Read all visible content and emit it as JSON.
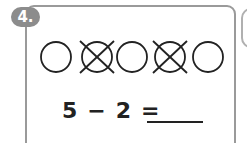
{
  "exercise": {
    "number": "4.",
    "circles": [
      {
        "cx": 56,
        "crossed": false
      },
      {
        "cx": 97,
        "crossed": true
      },
      {
        "cx": 132,
        "crossed": false
      },
      {
        "cx": 170,
        "crossed": true
      },
      {
        "cx": 208,
        "crossed": false
      }
    ],
    "equation": {
      "minuend": "5",
      "operator": "−",
      "subtrahend": "2",
      "equals": "=",
      "answer": ""
    }
  },
  "colors": {
    "badge": "#8c8c8c",
    "border": "#9a9a9a",
    "ink": "#222222"
  }
}
